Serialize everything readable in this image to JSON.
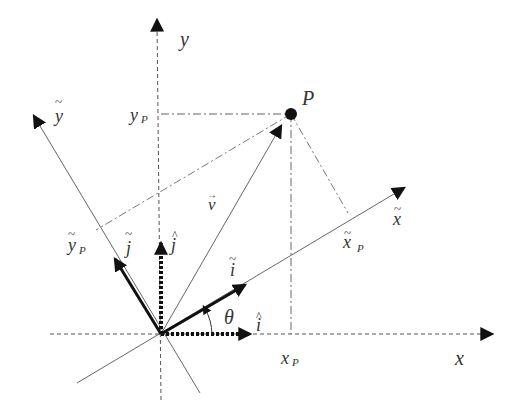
{
  "diagram": {
    "type": "coordinate-rotation",
    "labels": {
      "x_axis": "x",
      "y_axis": "y",
      "x_tilde_axis": "x",
      "y_tilde_axis": "y",
      "point": "P",
      "x_p": "x",
      "x_p_sub": "P",
      "y_p": "y",
      "y_p_sub": "P",
      "x_tilde_p": "x",
      "x_tilde_p_sub": "P",
      "y_tilde_p": "y",
      "y_tilde_p_sub": "P",
      "vector_v": "v",
      "i_hat": "i",
      "j_hat": "j",
      "i_tilde": "i",
      "j_tilde": "j",
      "angle": "θ",
      "tilde_mark": "~",
      "hat_mark": "^",
      "arrow_mark": "→"
    },
    "colors": {
      "line": "#555555",
      "thick": "#111111",
      "text": "#333333"
    }
  }
}
